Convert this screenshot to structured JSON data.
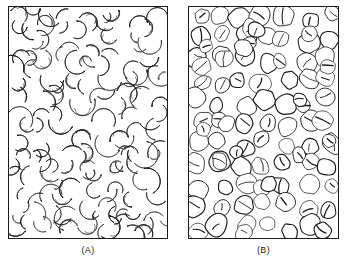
{
  "figure": {
    "background_color": "#ffffff",
    "ink_color": "#1a1a1a",
    "cell_fill_color": "#ffffff",
    "width": 347,
    "height": 262
  },
  "panels": [
    {
      "id": "A",
      "caption": "(A)",
      "content_description": "sickle-shaped red blood cells",
      "cell_shape": "sickle",
      "border_color": "#1a1a1a",
      "frame": {
        "x": 8,
        "y": 6,
        "width": 160,
        "height": 233
      },
      "density": "dense"
    },
    {
      "id": "B",
      "caption": "(B)",
      "content_description": "normal round red blood cells",
      "cell_shape": "round",
      "border_color": "#1a1a1a",
      "frame": {
        "x": 188,
        "y": 6,
        "width": 151,
        "height": 233
      },
      "density": "packed"
    }
  ]
}
